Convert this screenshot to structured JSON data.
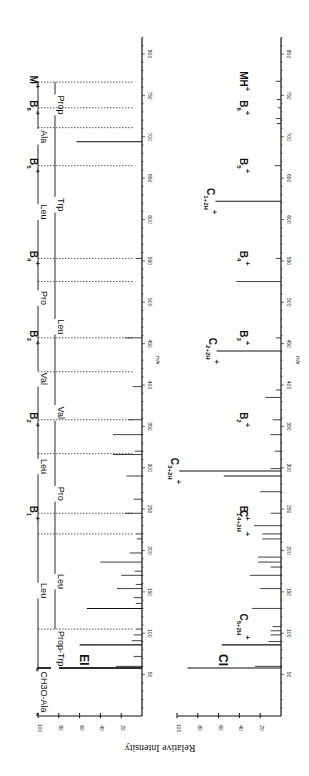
{
  "figure": {
    "orientation": "rotated-90-ccw",
    "y_axis_title": "Relative Intensity",
    "x_axis_title": "m/e"
  },
  "chart_data": [
    {
      "type": "bar",
      "panel": "EI",
      "title": "EI",
      "xlabel": "m/e",
      "ylabel": "Relative Intensity",
      "xlim": [
        0,
        820
      ],
      "ylim": [
        0,
        100
      ],
      "x_ticks": [
        50,
        100,
        150,
        200,
        250,
        300,
        350,
        400,
        450,
        500,
        550,
        600,
        650,
        700,
        750,
        800
      ],
      "y_ticks": [
        20,
        40,
        60,
        80,
        100
      ],
      "peaks": [
        {
          "mz": 58,
          "intensity": 100
        },
        {
          "mz": 60,
          "intensity": 25
        },
        {
          "mz": 72,
          "intensity": 8
        },
        {
          "mz": 86,
          "intensity": 60
        },
        {
          "mz": 91,
          "intensity": 10
        },
        {
          "mz": 98,
          "intensity": 8
        },
        {
          "mz": 105,
          "intensity": 6
        },
        {
          "mz": 130,
          "intensity": 53
        },
        {
          "mz": 136,
          "intensity": 6
        },
        {
          "mz": 143,
          "intensity": 8
        },
        {
          "mz": 154,
          "intensity": 24
        },
        {
          "mz": 159,
          "intensity": 6
        },
        {
          "mz": 170,
          "intensity": 20
        },
        {
          "mz": 175,
          "intensity": 7
        },
        {
          "mz": 186,
          "intensity": 40
        },
        {
          "mz": 197,
          "intensity": 12
        },
        {
          "mz": 214,
          "intensity": 5
        },
        {
          "mz": 220,
          "intensity": 6
        },
        {
          "mz": 245,
          "intensity": 16
        },
        {
          "mz": 262,
          "intensity": 8
        },
        {
          "mz": 290,
          "intensity": 15
        },
        {
          "mz": 316,
          "intensity": 28
        },
        {
          "mz": 320,
          "intensity": 7
        },
        {
          "mz": 340,
          "intensity": 28
        },
        {
          "mz": 358,
          "intensity": 13
        },
        {
          "mz": 398,
          "intensity": 9
        },
        {
          "mz": 457,
          "intensity": 16
        },
        {
          "mz": 553,
          "intensity": 6
        },
        {
          "mz": 694,
          "intensity": 63
        }
      ],
      "ion_annotations": [
        {
          "label": "B",
          "sub": "1",
          "sup": "+",
          "mz": 245
        },
        {
          "label": "B",
          "sub": "2",
          "sup": "+",
          "mz": 358
        },
        {
          "label": "B",
          "sub": "3",
          "sup": "+",
          "mz": 457
        },
        {
          "label": "B",
          "sub": "4",
          "sup": "+",
          "mz": 553
        },
        {
          "label": "B",
          "sub": "5",
          "sup": "+",
          "mz": 665
        },
        {
          "label": "B",
          "sub": "6",
          "sup": "+",
          "mz": 735
        },
        {
          "label": "M",
          "sub": "",
          "sup": "+",
          "mz": 766
        }
      ],
      "sequence_lines": [
        {
          "row": "B-series",
          "segments": [
            {
              "label": "CH3O-Ala",
              "from": 0,
              "to": 58
            },
            {
              "label": "Leu",
              "from": 58,
              "to": 245
            },
            {
              "label": "Leu",
              "from": 245,
              "to": 358
            },
            {
              "label": "Val",
              "from": 358,
              "to": 457
            },
            {
              "label": "Pro",
              "from": 457,
              "to": 553
            },
            {
              "label": "Leu",
              "from": 553,
              "to": 665
            },
            {
              "label": "Ala",
              "from": 665,
              "to": 735
            },
            {
              "label": "",
              "from": 735,
              "to": 766
            }
          ]
        },
        {
          "row": "reverse-series",
          "segments": [
            {
              "label": "Prop-Trp",
              "from": 58,
              "to": 105
            },
            {
              "label": "Leu",
              "from": 105,
              "to": 220
            },
            {
              "label": "Pro",
              "from": 220,
              "to": 317
            },
            {
              "label": "Val",
              "from": 317,
              "to": 416
            },
            {
              "label": "Leu",
              "from": 416,
              "to": 525
            },
            {
              "label": "Trp",
              "from": 525,
              "to": 711
            },
            {
              "label": "Prop",
              "from": 711,
              "to": 766
            }
          ]
        }
      ],
      "dashed_markers": [
        105,
        220,
        245,
        317,
        358,
        416,
        457,
        525,
        553,
        665,
        711,
        735,
        766
      ],
      "peak_numbers": [
        {
          "mz": 245,
          "text": "245"
        },
        {
          "mz": 358,
          "text": "358"
        },
        {
          "mz": 457,
          "text": "457"
        },
        {
          "mz": 553,
          "text": "553"
        },
        {
          "mz": 665,
          "text": "665"
        },
        {
          "mz": 735,
          "text": "735"
        },
        {
          "mz": 766,
          "text": "767"
        }
      ]
    },
    {
      "type": "bar",
      "panel": "CI",
      "title": "CI",
      "xlabel": "m/e",
      "ylabel": "Relative Intensity",
      "xlim": [
        0,
        820
      ],
      "ylim": [
        0,
        100
      ],
      "x_ticks": [
        50,
        100,
        150,
        200,
        250,
        300,
        350,
        400,
        450,
        500,
        550,
        600,
        650,
        700,
        750,
        800
      ],
      "y_ticks": [
        20,
        40,
        60,
        80,
        100
      ],
      "peaks": [
        {
          "mz": 58,
          "intensity": 90
        },
        {
          "mz": 60,
          "intensity": 25
        },
        {
          "mz": 86,
          "intensity": 57
        },
        {
          "mz": 90,
          "intensity": 12
        },
        {
          "mz": 98,
          "intensity": 10
        },
        {
          "mz": 103,
          "intensity": 10
        },
        {
          "mz": 108,
          "intensity": 8
        },
        {
          "mz": 130,
          "intensity": 28
        },
        {
          "mz": 154,
          "intensity": 20
        },
        {
          "mz": 170,
          "intensity": 30
        },
        {
          "mz": 180,
          "intensity": 10
        },
        {
          "mz": 186,
          "intensity": 22
        },
        {
          "mz": 192,
          "intensity": 22
        },
        {
          "mz": 214,
          "intensity": 18
        },
        {
          "mz": 220,
          "intensity": 18
        },
        {
          "mz": 230,
          "intensity": 26
        },
        {
          "mz": 245,
          "intensity": 10
        },
        {
          "mz": 271,
          "intensity": 20
        },
        {
          "mz": 290,
          "intensity": 55
        },
        {
          "mz": 296,
          "intensity": 98
        },
        {
          "mz": 299,
          "intensity": 10
        },
        {
          "mz": 320,
          "intensity": 6
        },
        {
          "mz": 340,
          "intensity": 10
        },
        {
          "mz": 358,
          "intensity": 8
        },
        {
          "mz": 385,
          "intensity": 15
        },
        {
          "mz": 394,
          "intensity": 5
        },
        {
          "mz": 441,
          "intensity": 62
        },
        {
          "mz": 457,
          "intensity": 5
        },
        {
          "mz": 525,
          "intensity": 43
        },
        {
          "mz": 553,
          "intensity": 5
        },
        {
          "mz": 622,
          "intensity": 63
        },
        {
          "mz": 665,
          "intensity": 6
        },
        {
          "mz": 716,
          "intensity": 4
        },
        {
          "mz": 722,
          "intensity": 5
        },
        {
          "mz": 735,
          "intensity": 3
        },
        {
          "mz": 745,
          "intensity": 4
        },
        {
          "mz": 767,
          "intensity": 5
        }
      ],
      "ion_annotations": [
        {
          "label": "C",
          "sub": "5+2H",
          "sup": "+",
          "mz": 108
        },
        {
          "label": "C",
          "sub": "4+2H",
          "sup": "+",
          "mz": 233
        },
        {
          "label": "B",
          "sub": "1",
          "sup": "+",
          "mz": 245
        },
        {
          "label": "C",
          "sub": "3+2H",
          "sup": "+",
          "mz": 296
        },
        {
          "label": "B",
          "sub": "2",
          "sup": "+",
          "mz": 358
        },
        {
          "label": "C",
          "sub": "2+2H",
          "sup": "+",
          "mz": 441
        },
        {
          "label": "B",
          "sub": "3",
          "sup": "+",
          "mz": 457
        },
        {
          "label": "C",
          "sub": "1+2H",
          "sup": "+",
          "mz": 622
        },
        {
          "label": "B",
          "sub": "4",
          "sup": "+",
          "mz": 553
        },
        {
          "label": "B",
          "sub": "5",
          "sup": "+",
          "mz": 665
        },
        {
          "label": "B",
          "sub": "6",
          "sup": "+",
          "mz": 735
        },
        {
          "label": "MH",
          "sub": "",
          "sup": "+",
          "mz": 767
        }
      ]
    }
  ]
}
